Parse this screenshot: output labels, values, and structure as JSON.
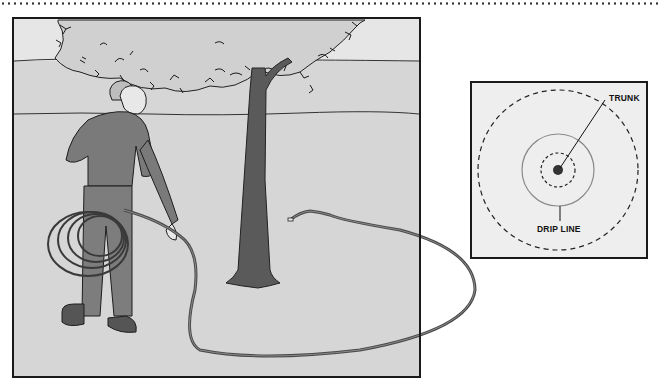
{
  "illustration": {
    "scene": "Person laying a garden hose in a loop around a tree",
    "colors": {
      "background": "#d9d9d9",
      "sky": "#e4e4e4",
      "trunk": "#5a5a5a",
      "clothing": "#7a7a7a",
      "hose": "#555555",
      "frame": "#1a1a1a"
    }
  },
  "inset": {
    "labels": {
      "trunk": "TRUNK",
      "drip_line": "DRIP LINE"
    },
    "colors": {
      "background": "#eeeeee",
      "dashed_circle": "#222222",
      "drip_line_circle": "#8a8a8a",
      "trunk_dot": "#333333"
    }
  }
}
